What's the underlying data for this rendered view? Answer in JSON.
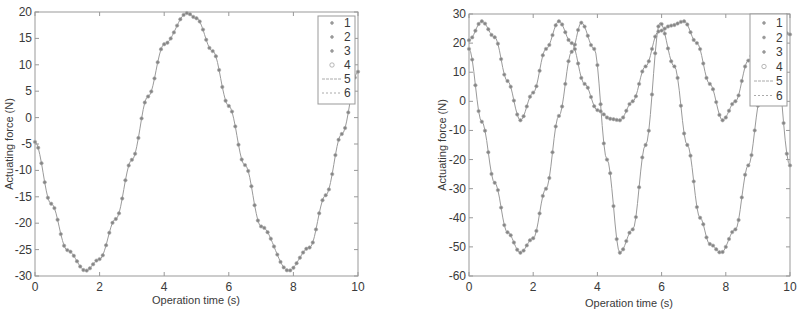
{
  "chart_data": [
    {
      "type": "line",
      "title": "",
      "xlabel": "Operation time (s)",
      "ylabel": "Actuating force (N)",
      "xlim": [
        0,
        10
      ],
      "ylim": [
        -30,
        20
      ],
      "xticks": [
        0,
        2,
        4,
        6,
        8,
        10
      ],
      "yticks": [
        20,
        15,
        10,
        5,
        0,
        -5,
        -10,
        -15,
        -20,
        -25,
        -30
      ],
      "grid": false,
      "legend": {
        "position": "upper right",
        "entries": [
          "1",
          "2",
          "3",
          "4",
          "5",
          "6"
        ]
      },
      "note": "All six series overlap on a single sinusoid",
      "series": [
        {
          "name": "1-6 (overlapping)",
          "x": [
            0,
            0.5,
            1,
            1.57,
            2,
            2.5,
            3,
            3.5,
            4,
            4.71,
            5,
            5.5,
            6,
            6.5,
            7,
            7.85,
            8.5,
            9,
            9.5,
            10
          ],
          "values": [
            -4.6,
            -16.3,
            -25.1,
            -29.0,
            -26.8,
            -19.2,
            -8.0,
            4.0,
            13.9,
            19.8,
            18.8,
            12.6,
            2.2,
            -9.0,
            -20.6,
            -29.0,
            -24.6,
            -14.7,
            -3.1,
            8.7
          ]
        }
      ]
    },
    {
      "type": "line",
      "title": "",
      "xlabel": "Operation time (s)",
      "ylabel": "Actuating force (N)",
      "xlim": [
        0,
        10
      ],
      "ylim": [
        -60,
        30
      ],
      "xticks": [
        0,
        2,
        4,
        6,
        8,
        10
      ],
      "yticks": [
        30,
        20,
        10,
        0,
        -10,
        -20,
        -30,
        -40,
        -50,
        -60
      ],
      "grid": false,
      "legend": {
        "position": "upper right",
        "entries": [
          "1",
          "2",
          "3",
          "4",
          "5",
          "6"
        ]
      },
      "series": [
        {
          "name": "upper curve",
          "x": [
            0,
            0.4,
            0.8,
            1.2,
            1.6,
            2.0,
            2.4,
            2.8,
            3.2,
            3.6,
            4.0,
            4.4,
            4.7,
            5.1,
            5.5,
            5.9,
            6.3,
            6.7,
            7.1,
            7.5,
            7.9,
            8.3,
            8.7,
            9.1,
            9.5,
            10
          ],
          "values": [
            21,
            27.5,
            22,
            7,
            -6.5,
            3,
            18,
            27.5,
            20,
            6,
            -3,
            -6,
            -6.5,
            0,
            12,
            24,
            26,
            27.5,
            20,
            6,
            -6.5,
            0,
            14,
            25,
            27,
            23
          ]
        },
        {
          "name": "lower curve",
          "x": [
            0,
            0.4,
            0.8,
            1.2,
            1.6,
            2.0,
            2.4,
            2.8,
            3.2,
            3.5,
            3.9,
            4.3,
            4.7,
            5.1,
            5.5,
            5.95,
            6.4,
            6.8,
            7.2,
            7.5,
            7.85,
            8.3,
            8.7,
            9.1,
            9.5,
            10
          ],
          "values": [
            18,
            -7,
            -28,
            -45,
            -52,
            -47,
            -30,
            -5,
            17,
            27,
            18,
            -20,
            -52,
            -44,
            -15,
            27,
            12,
            -15,
            -40,
            -49,
            -52,
            -44,
            -22,
            2,
            20,
            -22
          ]
        }
      ]
    }
  ],
  "charts": [
    {
      "ylabel": "Actuating force (N)",
      "xlabel": "Operation time (s)",
      "yticks": [
        "20",
        "15",
        "10",
        "5",
        "0",
        "-5",
        "-10",
        "-15",
        "-20",
        "-25",
        "-30"
      ],
      "xticks": [
        "0",
        "2",
        "4",
        "6",
        "8",
        "10"
      ],
      "legend": [
        "1",
        "2",
        "3",
        "4",
        "5",
        "6"
      ]
    },
    {
      "ylabel": "Actuating force (N)",
      "xlabel": "Operation time (s)",
      "yticks": [
        "30",
        "20",
        "10",
        "0",
        "-10",
        "-20",
        "-30",
        "-40",
        "-50",
        "-60"
      ],
      "xticks": [
        "0",
        "2",
        "4",
        "6",
        "8",
        "10"
      ],
      "legend": [
        "1",
        "2",
        "3",
        "4",
        "5",
        "6"
      ]
    }
  ],
  "colors": {
    "axis": "#8a8a8a",
    "curve": "#8c8c8c",
    "marker": "#7a7a7a",
    "text": "#3a3a3a"
  }
}
